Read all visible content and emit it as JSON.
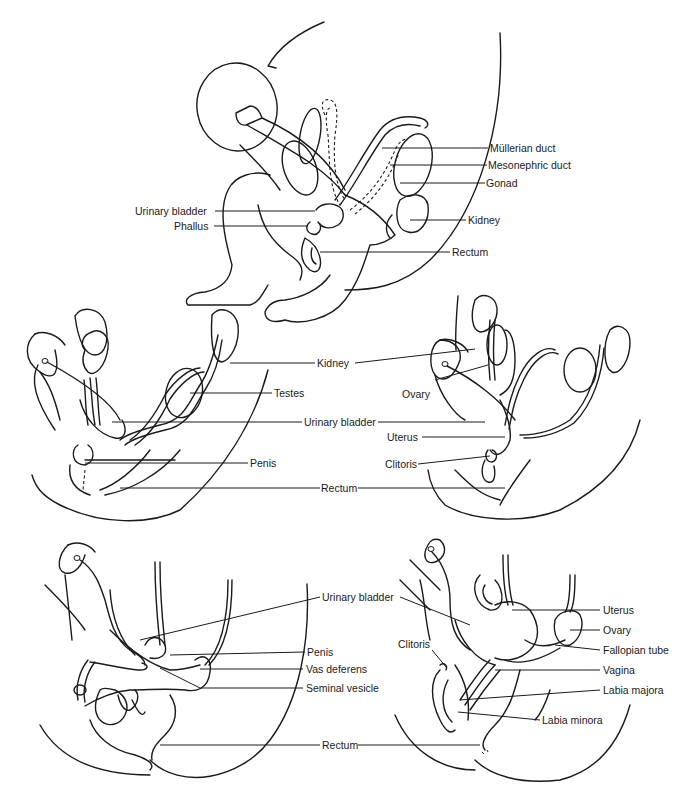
{
  "figure": {
    "type": "anatomical line diagram"
  },
  "panels": {
    "indifferent": {
      "labels": {
        "mullerian_duct": "Müllerian duct",
        "mesonephric_duct": "Mesonephric duct",
        "gonad": "Gonad",
        "kidney": "Kidney",
        "urinary_bladder": "Urinary bladder",
        "phallus": "Phallus",
        "rectum": "Rectum"
      }
    },
    "middle_shared": {
      "labels": {
        "kidney": "Kidney",
        "testes": "Testes",
        "urinary_bladder": "Urinary bladder",
        "penis": "Penis",
        "rectum": "Rectum",
        "ovary": "Ovary",
        "uterus": "Uterus",
        "clitoris": "Clitoris"
      }
    },
    "male_adult": {
      "labels": {
        "urinary_bladder": "Urinary bladder",
        "penis": "Penis",
        "vas_deferens": "Vas deferens",
        "seminal_vesicle": "Seminal vesicle",
        "rectum": "Rectum"
      }
    },
    "female_adult": {
      "labels": {
        "uterus": "Uterus",
        "ovary": "Ovary",
        "fallopian_tube": "Fallopian tube",
        "clitoris": "Clitoris",
        "vagina": "Vagina",
        "labia_majora": "Labia majora",
        "labia_minora": "Labia minora"
      }
    }
  },
  "colors": {
    "ink": "#1a1a1a",
    "background": "#ffffff"
  }
}
